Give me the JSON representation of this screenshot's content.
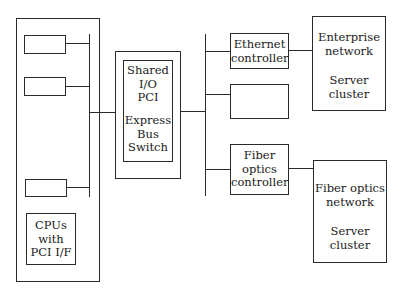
{
  "diagram": {
    "host": {
      "slots": [
        "",
        "",
        ""
      ],
      "cpu_label": "CPUs\nwith\nPCI I/F"
    },
    "switch": {
      "label_top": "Shared\nI/O\nPCI",
      "label_bottom": "Express\nBus\nSwitch"
    },
    "controllers": [
      {
        "label": "Ethernet\ncontroller"
      },
      {
        "label": ""
      },
      {
        "label": "Fiber\noptics\ncontroller"
      }
    ],
    "networks": [
      {
        "name": "Enterprise\nnetwork",
        "sub": "Server\ncluster"
      },
      {
        "name": "Fiber optics\nnetwork",
        "sub": "Server\ncluster"
      }
    ]
  }
}
